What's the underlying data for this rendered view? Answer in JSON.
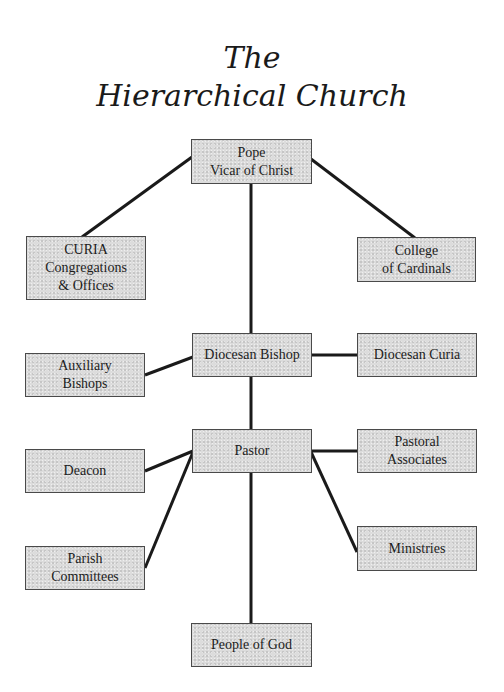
{
  "title": {
    "line1": "The",
    "line2": "Hierarchical Church"
  },
  "colors": {
    "line": "#1a1a1a",
    "box_border": "#4a4a4a",
    "box_fill": "#dcdcdc",
    "text": "#1c1c1c"
  },
  "nodes": {
    "pope": {
      "lines": [
        "Pope",
        "Vicar of Christ"
      ]
    },
    "curia": {
      "lines": [
        "CURIA",
        "Congregations",
        "& Offices"
      ]
    },
    "college": {
      "lines": [
        "College",
        "of Cardinals"
      ]
    },
    "diocesan_bishop": {
      "lines": [
        "Diocesan Bishop"
      ]
    },
    "auxiliary_bishops": {
      "lines": [
        "Auxiliary",
        "Bishops"
      ]
    },
    "diocesan_curia": {
      "lines": [
        "Diocesan Curia"
      ]
    },
    "pastor": {
      "lines": [
        "Pastor"
      ]
    },
    "deacon": {
      "lines": [
        "Deacon"
      ]
    },
    "pastoral_associates": {
      "lines": [
        "Pastoral",
        "Associates"
      ]
    },
    "parish_committees": {
      "lines": [
        "Parish",
        "Committees"
      ]
    },
    "ministries": {
      "lines": [
        "Ministries"
      ]
    },
    "people_of_god": {
      "lines": [
        "People of God"
      ]
    }
  },
  "edges": [
    [
      "pope",
      "curia"
    ],
    [
      "pope",
      "college"
    ],
    [
      "pope",
      "diocesan_bishop"
    ],
    [
      "diocesan_bishop",
      "auxiliary_bishops"
    ],
    [
      "diocesan_bishop",
      "diocesan_curia"
    ],
    [
      "diocesan_bishop",
      "pastor"
    ],
    [
      "pastor",
      "deacon"
    ],
    [
      "pastor",
      "pastoral_associates"
    ],
    [
      "pastor",
      "parish_committees"
    ],
    [
      "pastor",
      "ministries"
    ],
    [
      "pastor",
      "people_of_god"
    ]
  ]
}
